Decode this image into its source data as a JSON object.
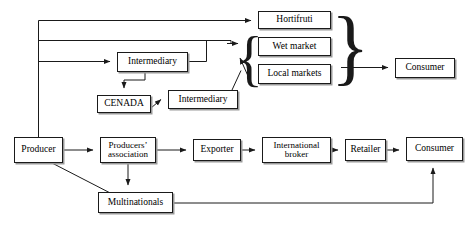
{
  "diagram": {
    "line_color": "#1a1a1a",
    "box_border_color": "#1a1a1a",
    "box_shadow_color": "#9a9a9a",
    "background_color": "#ffffff"
  },
  "nodes": [
    {
      "id": "hortifruti",
      "label": "Hortifruti",
      "x": 258,
      "y": 11,
      "w": 73,
      "h": 18,
      "font_size": 9.5
    },
    {
      "id": "wet_market",
      "label": "Wet market",
      "x": 258,
      "y": 37,
      "w": 73,
      "h": 19,
      "font_size": 9.5
    },
    {
      "id": "local_markets",
      "label": "Local markets",
      "x": 258,
      "y": 64,
      "w": 73,
      "h": 20,
      "font_size": 9.5
    },
    {
      "id": "consumer_top",
      "label": "Consumer",
      "x": 395,
      "y": 58,
      "w": 60,
      "h": 20,
      "font_size": 9.5
    },
    {
      "id": "intermediary_1",
      "label": "Intermediary",
      "x": 117,
      "y": 52,
      "w": 71,
      "h": 20,
      "font_size": 9.5
    },
    {
      "id": "cenada",
      "label": "CENADA",
      "x": 97,
      "y": 95,
      "w": 54,
      "h": 18,
      "font_size": 9.5
    },
    {
      "id": "intermediary_2",
      "label": "Intermediary",
      "x": 168,
      "y": 90,
      "w": 70,
      "h": 19,
      "font_size": 9.5
    },
    {
      "id": "producer",
      "label": "Producer",
      "x": 14,
      "y": 137,
      "w": 49,
      "h": 26,
      "font_size": 9.5
    },
    {
      "id": "producers_assoc",
      "label": "Producers’\nassociation",
      "x": 100,
      "y": 137,
      "w": 56,
      "h": 26,
      "font_size": 9
    },
    {
      "id": "exporter",
      "label": "Exporter",
      "x": 193,
      "y": 139,
      "w": 48,
      "h": 22,
      "font_size": 9.5
    },
    {
      "id": "intl_broker",
      "label": "International\nbroker",
      "x": 262,
      "y": 137,
      "w": 69,
      "h": 26,
      "font_size": 9
    },
    {
      "id": "retailer",
      "label": "Retailer",
      "x": 345,
      "y": 139,
      "w": 41,
      "h": 22,
      "font_size": 9.5
    },
    {
      "id": "consumer_bottom",
      "label": "Consumer",
      "x": 406,
      "y": 137,
      "w": 57,
      "h": 24,
      "font_size": 9.5
    },
    {
      "id": "multinationals",
      "label": "Multinationals",
      "x": 98,
      "y": 192,
      "w": 75,
      "h": 21,
      "font_size": 9.5
    }
  ],
  "braces": [
    {
      "id": "left-brace",
      "glyph": "{",
      "x": 238,
      "y": 30,
      "height": 62,
      "font_size": 58
    },
    {
      "id": "right-brace",
      "glyph": "}",
      "x": 333,
      "y": 4,
      "height": 88,
      "font_size": 84
    }
  ],
  "edges": [
    {
      "id": "producer-to-trunk"
    },
    {
      "id": "trunk-to-hortifruti"
    },
    {
      "id": "trunk-to-wetmarket-group"
    },
    {
      "id": "trunk-to-intermediary-1"
    },
    {
      "id": "intermediary1-to-group"
    },
    {
      "id": "intermediary1-to-cenada"
    },
    {
      "id": "cenada-to-intermediary-2"
    },
    {
      "id": "intermediary2-to-group"
    },
    {
      "id": "group-to-consumer-top"
    },
    {
      "id": "producer-to-producers-assoc"
    },
    {
      "id": "producer-to-multinationals"
    },
    {
      "id": "producers-assoc-to-exporter"
    },
    {
      "id": "producers-assoc-to-multinationals"
    },
    {
      "id": "exporter-to-intl-broker"
    },
    {
      "id": "intl-broker-to-retailer"
    },
    {
      "id": "retailer-to-consumer-bottom"
    },
    {
      "id": "multinationals-to-consumer-bottom"
    }
  ]
}
